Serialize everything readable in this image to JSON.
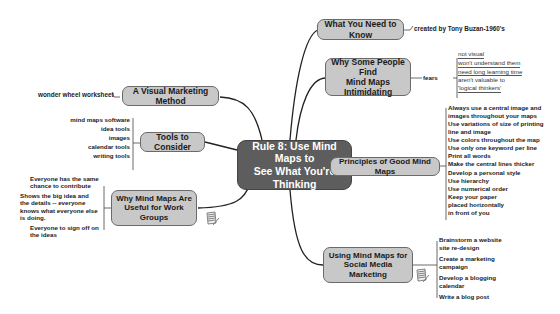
{
  "central": {
    "line1": "Rule 8: Use Mind Maps to",
    "line2": "See What You're Thinking"
  },
  "branches": {
    "what_to_know": {
      "label": "What You Need to Know",
      "leaves": [
        "created by Tony Buzan-1960's"
      ]
    },
    "intimidating": {
      "line1": "Why Some People Find",
      "line2": "Mind Maps Intimidating",
      "connector": "fears",
      "leaves": [
        "not visual",
        "won't understand them",
        "need long learning time",
        "aren't valuable to",
        "'logical thinkers'"
      ]
    },
    "principles": {
      "label": "Principles of Good Mind Maps",
      "leaves": [
        "Always use a central image and",
        "images throughout your maps",
        "Use variations of size of printing",
        "line and image",
        "Use colors throughout the map",
        "Use only one keyword per line",
        "Print all words",
        "Make the central lines thicker",
        "Develop a personal style",
        "Use hierarchy",
        "Use numerical order",
        "Keep your paper",
        "placed horizontally",
        "in front of you"
      ]
    },
    "social_media": {
      "line1": "Using Mind Maps for",
      "line2": "Social Media Marketing",
      "leaves": [
        "Brainstorm a website",
        "site re-design",
        "Create a marketing",
        "campaign",
        "Develop a blogging",
        "calendar",
        "Write a blog post"
      ]
    },
    "visual_marketing": {
      "label": "A Visual Marketing Method",
      "leaves": [
        "wonder wheel worksheet"
      ]
    },
    "tools": {
      "label": "Tools to Consider",
      "leaves": [
        "mind maps software",
        "idea tools",
        "images",
        "calendar tools",
        "writing tools"
      ]
    },
    "work_groups": {
      "line1": "Why Mind Maps Are",
      "line2": "Useful for Work Groups",
      "leaves": [
        "Everyone has the same",
        "chance to contribute",
        "Shows the big idea and",
        "the details -- everyone",
        "knows what everyone else",
        "is doing.",
        "Everyone to sign off on",
        "the ideas"
      ]
    }
  },
  "colors": {
    "central_fill": "#5d5d5d",
    "node_fill": "#c8c8c8",
    "line": "#222222"
  }
}
